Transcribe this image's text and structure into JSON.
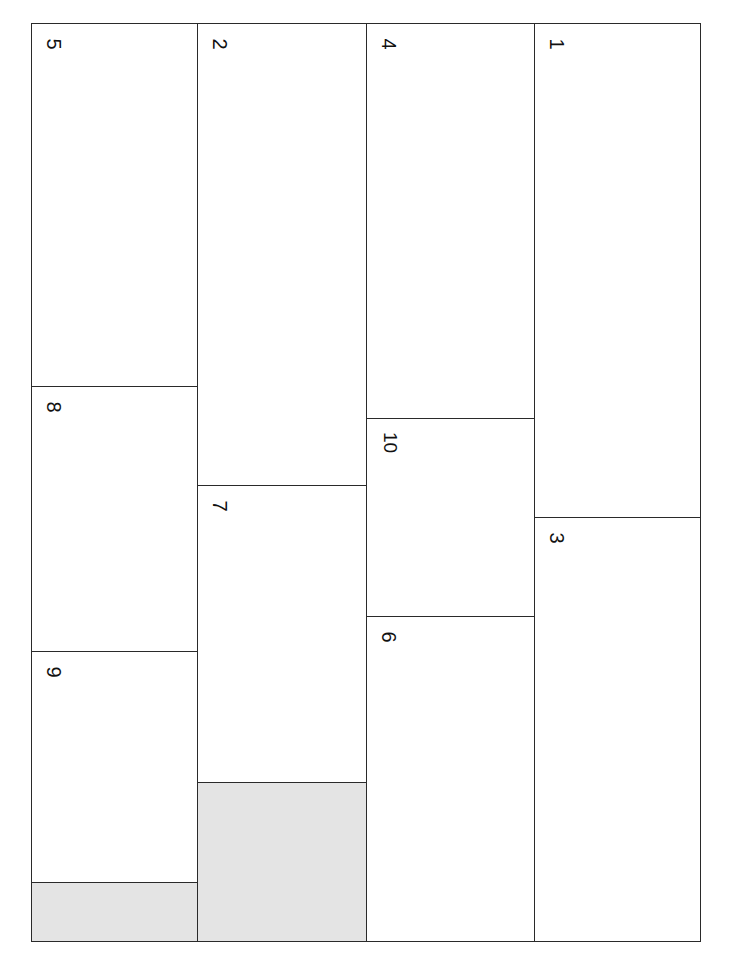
{
  "diagram": {
    "type": "rotated-page-layout",
    "fill_colors": {
      "empty": "#ffffff",
      "shaded": "#e4e4e4",
      "border": "#222222"
    },
    "columns": [
      {
        "cells": [
          {
            "label": "5",
            "shaded": false
          },
          {
            "label": "8",
            "shaded": false
          },
          {
            "label": "9",
            "shaded": false
          },
          {
            "label": "",
            "shaded": true
          }
        ]
      },
      {
        "cells": [
          {
            "label": "2",
            "shaded": false
          },
          {
            "label": "7",
            "shaded": false
          },
          {
            "label": "",
            "shaded": true
          }
        ]
      },
      {
        "cells": [
          {
            "label": "4",
            "shaded": false
          },
          {
            "label": "10",
            "shaded": false
          },
          {
            "label": "6",
            "shaded": false
          }
        ]
      },
      {
        "cells": [
          {
            "label": "1",
            "shaded": false
          },
          {
            "label": "3",
            "shaded": false
          }
        ]
      }
    ]
  }
}
